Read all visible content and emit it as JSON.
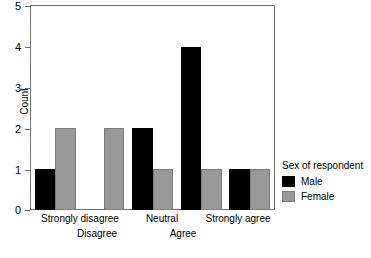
{
  "chart_data": {
    "type": "bar",
    "title": "",
    "subtitle": "",
    "xlabel": "",
    "ylabel": "Count",
    "categories": [
      "Strongly disagree",
      "Disagree",
      "Neutral",
      "Agree",
      "Strongly agree"
    ],
    "series": [
      {
        "name": "Male",
        "color": "#000000",
        "values": [
          1,
          0,
          2,
          4,
          1
        ]
      },
      {
        "name": "Female",
        "color": "#999999",
        "values": [
          2,
          2,
          1,
          1,
          1
        ]
      }
    ],
    "ylim": [
      0,
      5
    ],
    "ytick_labels": [
      "0",
      "1",
      "2",
      "3",
      "4",
      "5"
    ],
    "yticks": [
      0,
      1,
      2,
      3,
      4,
      5
    ],
    "grid": false,
    "legend": {
      "title": "Sex of respondent",
      "position": "right",
      "entries": [
        {
          "label": "Male",
          "color": "#000000"
        },
        {
          "label": "Female",
          "color": "#999999"
        }
      ]
    },
    "axis_color": "#6f6f6f",
    "background": "#ffffff",
    "note": "Grouped bar chart; Male bar for Disagree category has count 0 so no black bar is drawn."
  },
  "axis": {
    "y_label": "Count",
    "ticks": [
      "5",
      "4",
      "3",
      "2",
      "1",
      "0"
    ]
  },
  "x_labels": {
    "row1": [
      "Strongly disagree",
      "Neutral",
      "Strongly agree"
    ],
    "row2": [
      "Disagree",
      "Agree"
    ]
  },
  "legend": {
    "title": "Sex of respondent",
    "male_label": "Male",
    "female_label": "Female"
  }
}
